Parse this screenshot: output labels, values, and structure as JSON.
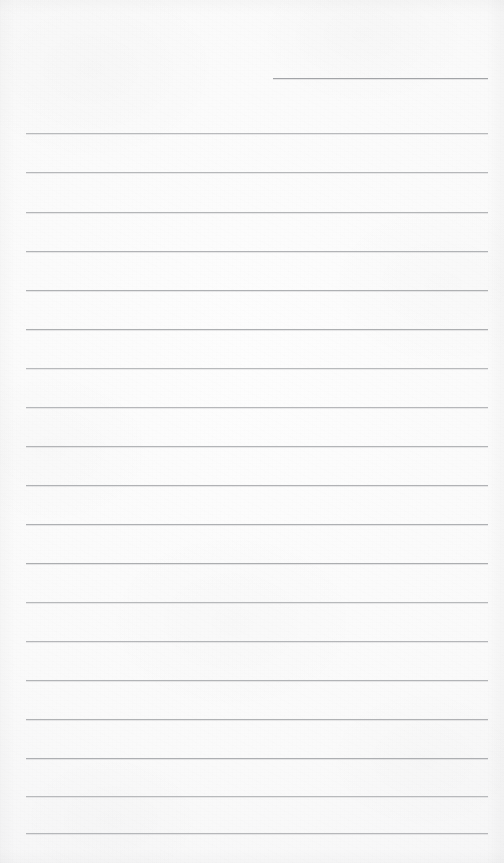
{
  "document": {
    "kind": "blank-ruled-notepaper-scan",
    "page_width": 504,
    "page_height": 863,
    "paper_color": "#fbfbfb",
    "rule_color": "#a9abae",
    "content_text": "",
    "handwriting_text": "",
    "printed_text": ""
  },
  "rules": {
    "left_margin_x": 26,
    "right_margin_x": 488,
    "line_spacing": 39,
    "first_full_line_y": 133,
    "full_line_count": 19,
    "partial_line": {
      "start_x": 273,
      "end_x": 488,
      "y": 78
    },
    "full_lines": [
      {
        "y": 133,
        "x": 26,
        "width": 462
      },
      {
        "y": 172,
        "x": 26,
        "width": 462
      },
      {
        "y": 212,
        "x": 26,
        "width": 462
      },
      {
        "y": 251,
        "x": 26,
        "width": 462
      },
      {
        "y": 290,
        "x": 26,
        "width": 462
      },
      {
        "y": 329,
        "x": 26,
        "width": 462
      },
      {
        "y": 368,
        "x": 26,
        "width": 462
      },
      {
        "y": 407,
        "x": 26,
        "width": 462
      },
      {
        "y": 446,
        "x": 26,
        "width": 462
      },
      {
        "y": 485,
        "x": 26,
        "width": 462
      },
      {
        "y": 524,
        "x": 26,
        "width": 462
      },
      {
        "y": 563,
        "x": 26,
        "width": 462
      },
      {
        "y": 602,
        "x": 26,
        "width": 462
      },
      {
        "y": 641,
        "x": 26,
        "width": 462
      },
      {
        "y": 680,
        "x": 26,
        "width": 462
      },
      {
        "y": 719,
        "x": 26,
        "width": 462
      },
      {
        "y": 758,
        "x": 26,
        "width": 462
      },
      {
        "y": 796,
        "x": 26,
        "width": 462
      },
      {
        "y": 833,
        "x": 26,
        "width": 462
      }
    ]
  }
}
